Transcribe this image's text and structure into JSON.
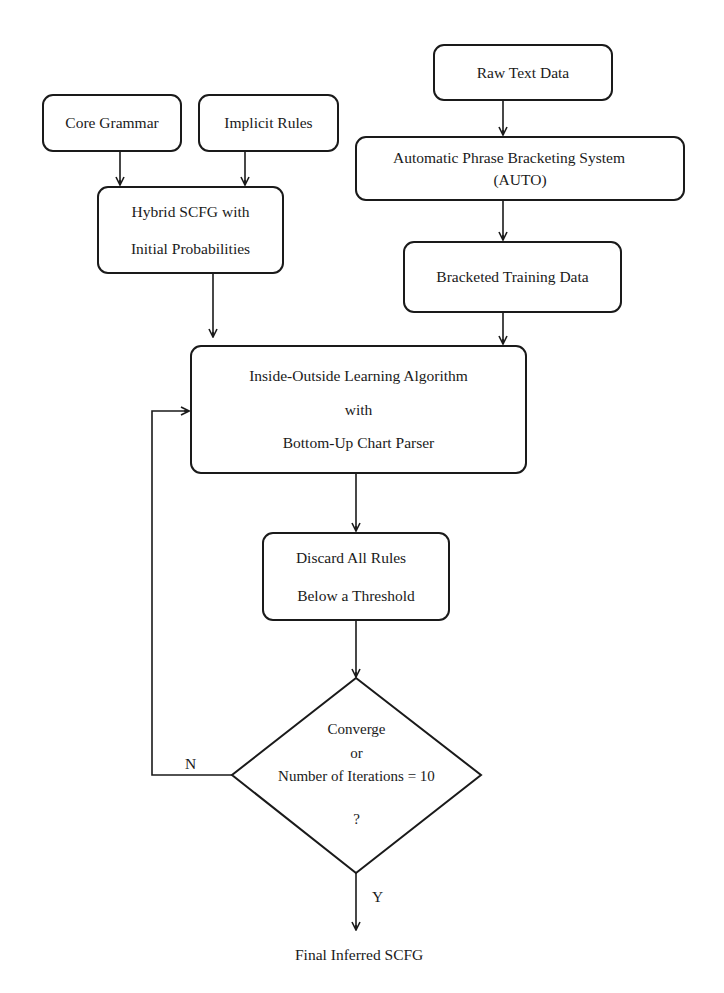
{
  "diagram": {
    "type": "flowchart",
    "nodes": {
      "core_grammar": {
        "label": "Core Grammar"
      },
      "implicit_rules": {
        "label": "Implicit Rules"
      },
      "hybrid_scfg": {
        "line1": "Hybrid SCFG with",
        "line2": "Initial Probabilities"
      },
      "raw_text": {
        "label": "Raw Text Data"
      },
      "auto_system": {
        "line1": "Automatic Phrase Bracketing System",
        "line2": "(AUTO)"
      },
      "bracketed_data": {
        "label": "Bracketed Training Data"
      },
      "inside_outside": {
        "line1": "Inside-Outside Learning Algorithm",
        "line2": "with",
        "line3": "Bottom-Up Chart Parser"
      },
      "discard_rules": {
        "line1": "Discard  All  Rules",
        "line2": "Below a Threshold"
      },
      "decision": {
        "line1": "Converge",
        "line2": "or",
        "line3": "Number of Iterations = 10",
        "line4": "?"
      },
      "final_output": {
        "label": "Final Inferred SCFG"
      }
    },
    "edge_labels": {
      "no": "N",
      "yes": "Y"
    },
    "edges": [
      {
        "from": "core_grammar",
        "to": "hybrid_scfg"
      },
      {
        "from": "implicit_rules",
        "to": "hybrid_scfg"
      },
      {
        "from": "raw_text",
        "to": "auto_system"
      },
      {
        "from": "auto_system",
        "to": "bracketed_data"
      },
      {
        "from": "hybrid_scfg",
        "to": "inside_outside"
      },
      {
        "from": "bracketed_data",
        "to": "inside_outside"
      },
      {
        "from": "inside_outside",
        "to": "discard_rules"
      },
      {
        "from": "discard_rules",
        "to": "decision"
      },
      {
        "from": "decision",
        "to": "inside_outside",
        "label": "N"
      },
      {
        "from": "decision",
        "to": "final_output",
        "label": "Y"
      }
    ],
    "colors": {
      "stroke": "#1a1a1a",
      "background": "#ffffff"
    }
  }
}
